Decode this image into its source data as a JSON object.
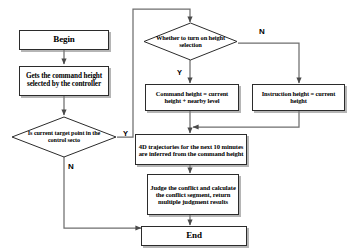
{
  "diagram": {
    "type": "flowchart",
    "background": "#ffffff",
    "line_color": "#555555",
    "border_color": "#2b2b2b",
    "nodes": {
      "begin": {
        "label": "Begin",
        "shape": "rectangle"
      },
      "get_command_height": {
        "label": "Gets the command height selected by the controller",
        "shape": "rectangle"
      },
      "target_in_sector": {
        "label": "Is  current target point in the control secto",
        "shape": "diamond"
      },
      "height_selection": {
        "label": "Whether to turn on  height selection",
        "shape": "diamond"
      },
      "command_height": {
        "label": "Command height = current height + nearby level",
        "shape": "rectangle"
      },
      "instruction_height": {
        "label": "Instruction height = current height",
        "shape": "rectangle"
      },
      "trajectories": {
        "label": "4D trajectories for the next 10 minutes are inferred from the command height",
        "shape": "rectangle"
      },
      "judge_conflict": {
        "label": "Judge the conflict and calculate the conflict segment, return multiple judgment results",
        "shape": "rectangle"
      },
      "end": {
        "label": "End",
        "shape": "rectangle"
      }
    },
    "edge_labels": {
      "target_yes": "Y",
      "target_no": "N",
      "selection_yes": "Y",
      "selection_no": "N"
    }
  }
}
